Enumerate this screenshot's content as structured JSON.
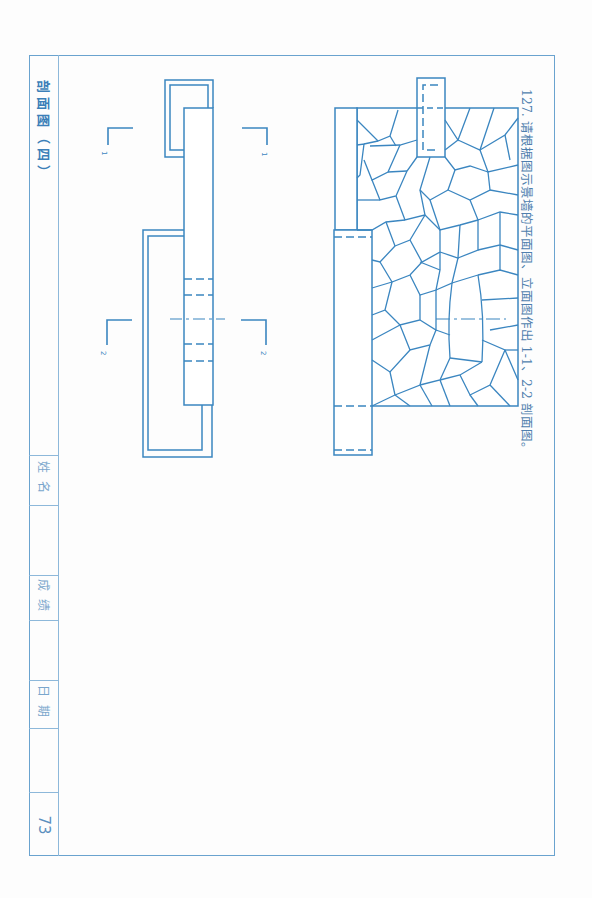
{
  "question": {
    "number": "127.",
    "text": "请根据图示景墙的平面图、立面图作出 1-1、2-2 剖面图。"
  },
  "sidebar": {
    "title": "剖面图（四）",
    "fields": [
      {
        "label": "姓名",
        "value": ""
      },
      {
        "label": "成绩",
        "value": ""
      },
      {
        "label": "日期",
        "value": ""
      }
    ],
    "page_number": "73"
  },
  "drawings": {
    "elevation": {
      "name": "景墙立面图",
      "line_color": "#3b86c0"
    },
    "plan": {
      "name": "景墙平面图",
      "line_color": "#3b86c0",
      "section_marks": [
        {
          "id": "1",
          "label": "1"
        },
        {
          "id": "2",
          "label": "2"
        }
      ]
    }
  },
  "colors": {
    "frame": "#6aa3cf",
    "drawing_line": "#3b86c0",
    "text": "#4f7fae"
  }
}
